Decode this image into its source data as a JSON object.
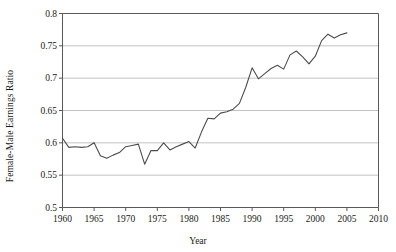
{
  "chart_data": {
    "type": "line",
    "title": "",
    "xlabel": "Year",
    "ylabel": "Female-Male Earnings Ratio",
    "xlim": [
      1960,
      2010
    ],
    "ylim": [
      0.5,
      0.8
    ],
    "xticks": [
      1960,
      1965,
      1970,
      1975,
      1980,
      1985,
      1990,
      1995,
      2000,
      2005,
      2010
    ],
    "yticks": [
      0.5,
      0.55,
      0.6,
      0.65,
      0.7,
      0.75,
      0.8
    ],
    "ytick_labels": [
      "0.5",
      "0.55",
      "0.6",
      "0.65",
      "0.7",
      "0.75",
      "0.8"
    ],
    "xtick_labels": [
      "1960",
      "1965",
      "1970",
      "1975",
      "1980",
      "1985",
      "1990",
      "1995",
      "2000",
      "2005",
      "2010"
    ],
    "grid": "horizontal",
    "legend": "none",
    "line_color": "#4d4d4d",
    "grid_color": "#b3b3b3",
    "axis_color": "#595959",
    "background_color": "#ffffff",
    "x": [
      1960,
      1961,
      1962,
      1963,
      1964,
      1965,
      1966,
      1967,
      1968,
      1969,
      1970,
      1971,
      1972,
      1973,
      1974,
      1975,
      1976,
      1977,
      1978,
      1979,
      1980,
      1981,
      1982,
      1983,
      1984,
      1985,
      1986,
      1987,
      1988,
      1989,
      1990,
      1991,
      1992,
      1993,
      1994,
      1995,
      1996,
      1997,
      1998,
      1999,
      2000,
      2001,
      2002,
      2003,
      2004,
      2005
    ],
    "values": [
      0.607,
      0.593,
      0.594,
      0.593,
      0.594,
      0.6,
      0.58,
      0.576,
      0.581,
      0.585,
      0.594,
      0.596,
      0.598,
      0.567,
      0.588,
      0.588,
      0.6,
      0.589,
      0.594,
      0.598,
      0.602,
      0.592,
      0.617,
      0.638,
      0.637,
      0.646,
      0.648,
      0.652,
      0.661,
      0.686,
      0.716,
      0.699,
      0.707,
      0.715,
      0.72,
      0.714,
      0.736,
      0.742,
      0.733,
      0.722,
      0.734,
      0.758,
      0.768,
      0.762,
      0.767,
      0.77
    ]
  }
}
